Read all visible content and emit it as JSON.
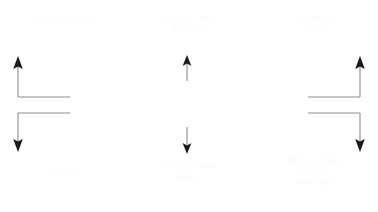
{
  "diagram": {
    "background_color": "#ffffff",
    "line_color": "#8c8c8c",
    "arrowhead_color": "#1a1a1a",
    "text_color": "#fcfcfc",
    "columns": [
      {
        "id": "left",
        "caption_top": "इसका व आगे फटे ।",
        "caption_bottom": "भा. आइसी",
        "arrows": [
          {
            "name": "elbow-arrow-up",
            "direction": "up",
            "shape": "elbow-left-up"
          },
          {
            "name": "elbow-arrow-down",
            "direction": "down",
            "shape": "elbow-left-down"
          }
        ]
      },
      {
        "id": "center",
        "caption_top": "रिक जो ई. भाषा\nफीजनी प्रेस",
        "caption_bottom": "भी. फीसे जाफाप\nभारीका ।",
        "arrows": [
          {
            "name": "straight-arrow-up",
            "direction": "up",
            "shape": "straight-up"
          },
          {
            "name": "straight-arrow-down",
            "direction": "down",
            "shape": "straight-down"
          }
        ]
      },
      {
        "id": "right",
        "caption_top": "राि. जिसेक भ\nक्षेत्री इंटर",
        "caption_bottom": "फिरि. जो वो फेस-\nभरणीकफ\nफजाए फिल ।",
        "arrows": [
          {
            "name": "elbow-arrow-up",
            "direction": "up",
            "shape": "elbow-right-up"
          },
          {
            "name": "elbow-arrow-down",
            "direction": "down",
            "shape": "elbow-right-down"
          }
        ]
      }
    ]
  }
}
